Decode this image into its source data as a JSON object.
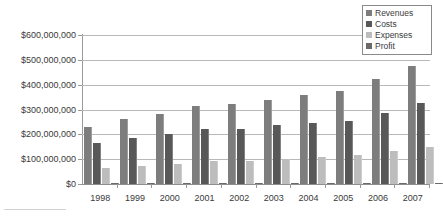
{
  "chart_data": {
    "type": "bar",
    "title": "",
    "subtitle": "",
    "xlabel": "",
    "ylabel": "",
    "categories": [
      "1998",
      "1999",
      "2000",
      "2001",
      "2002",
      "2003",
      "2004",
      "2005",
      "2006",
      "2007"
    ],
    "series": [
      {
        "name": "Revenues",
        "color": "#7d7d7d",
        "values": [
          231000000,
          262000000,
          283000000,
          315000000,
          324000000,
          340000000,
          359000000,
          374000000,
          422000000,
          477000000
        ]
      },
      {
        "name": "Costs",
        "color": "#585858",
        "values": [
          164000000,
          187000000,
          200000000,
          222000000,
          223000000,
          236000000,
          245000000,
          252000000,
          286000000,
          326000000
        ]
      },
      {
        "name": "Expenses",
        "color": "#bdbdbd",
        "values": [
          64000000,
          73000000,
          81000000,
          92000000,
          94000000,
          100000000,
          108000000,
          115000000,
          134000000,
          150000000
        ]
      },
      {
        "name": "Profit",
        "color": "#6a6a6a",
        "values": [
          1000000,
          1000000,
          1000000,
          1000000,
          4000000,
          3000000,
          4000000,
          4000000,
          1000000,
          1000000
        ]
      }
    ],
    "ylim": [
      0,
      600000000
    ],
    "ytick_values": [
      0,
      100000000,
      200000000,
      300000000,
      400000000,
      500000000,
      600000000
    ],
    "ytick_labels": [
      "$0",
      "$100,000,000",
      "$200,000,000",
      "$300,000,000",
      "$400,000,000",
      "$500,000,000",
      "$600,000,000"
    ],
    "grid": true,
    "legend_position": "top-right"
  },
  "legend": {
    "items": [
      {
        "label": "Revenues",
        "swatch": "revenues"
      },
      {
        "label": "Costs",
        "swatch": "costs"
      },
      {
        "label": "Expenses",
        "swatch": "expenses"
      },
      {
        "label": "Profit",
        "swatch": "profit"
      }
    ]
  }
}
